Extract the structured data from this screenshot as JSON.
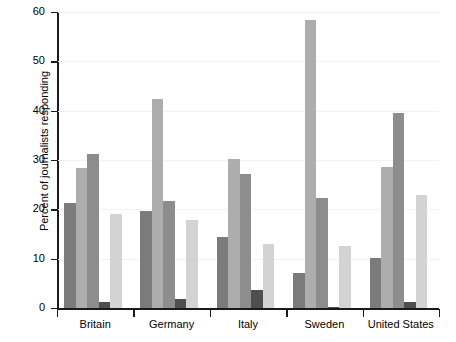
{
  "chart_data": {
    "type": "bar",
    "title": "",
    "xlabel": "",
    "ylabel": "Percent of journalists responding",
    "categories": [
      "Britain",
      "Germany",
      "Italy",
      "Sweden",
      "United States"
    ],
    "ylim": [
      0,
      60
    ],
    "yticks": [
      0,
      10,
      20,
      30,
      40,
      50,
      60
    ],
    "ytick_labels": [
      "0",
      "10",
      "20",
      "30",
      "40",
      "50",
      "60"
    ],
    "grid": true,
    "legend": "none",
    "series": [
      {
        "name": "Series 1",
        "color": "#7b7b7b",
        "values": [
          21.3,
          19.6,
          14.3,
          7.1,
          10.2
        ]
      },
      {
        "name": "Series 2",
        "color": "#adadad",
        "values": [
          28.3,
          42.3,
          30.3,
          58.4,
          28.5
        ]
      },
      {
        "name": "Series 3",
        "color": "#8d8d8d",
        "values": [
          31.3,
          21.6,
          27.1,
          22.2,
          39.5
        ]
      },
      {
        "name": "Series 4",
        "color": "#4f4f4f",
        "values": [
          1.3,
          1.8,
          3.7,
          0.3,
          1.2
        ]
      },
      {
        "name": "Series 5",
        "color": "#d3d3d3",
        "values": [
          19.1,
          17.9,
          12.9,
          12.5,
          23.0
        ]
      }
    ]
  }
}
